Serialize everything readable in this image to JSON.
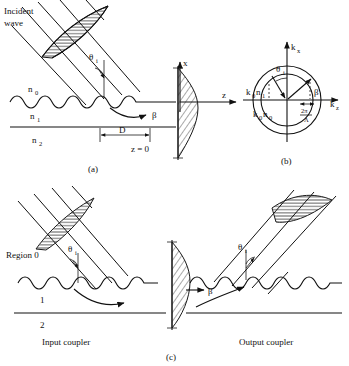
{
  "figure": {
    "panels": [
      {
        "id": "a",
        "caption": "(a)",
        "labels": {
          "incident_wave_line1": "Incident",
          "incident_wave_line2": "wave",
          "angle": "θ",
          "angle_sub": "i",
          "index_cover": "n",
          "index_cover_sub": "0",
          "index_guide": "n",
          "index_guide_sub": "1",
          "index_substrate": "n",
          "index_substrate_sub": "2",
          "propagation_constant": "β",
          "axis_x": "x",
          "axis_z": "z",
          "grating_length": "D",
          "origin": "z = 0"
        }
      },
      {
        "id": "b",
        "caption": "(b)",
        "labels": {
          "axis_kx": "k",
          "axis_kx_sub": "x",
          "axis_kz": "k",
          "axis_kz_sub": "z",
          "radius_outer": "k",
          "radius_outer_sub": "0",
          "radius_outer_index": "n",
          "radius_outer_index_sub": "1",
          "radius_inner": "k",
          "radius_inner_sub": "0",
          "radius_inner_index": "n",
          "radius_inner_index_sub": "0",
          "angle": "θ",
          "angle_sub": "i",
          "propagation_constant": "β",
          "grating_vector_num": "2π",
          "grating_vector_den": "Λ"
        }
      },
      {
        "id": "c",
        "caption": "(c)",
        "labels": {
          "region_0": "Region 0",
          "region_1": "1",
          "region_2": "2",
          "input_coupler": "Input coupler",
          "output_coupler": "Output coupler",
          "angle_in": "θ",
          "angle_in_sub": "i",
          "angle_out": "θ",
          "angle_out_sub": "i",
          "propagation_constant": "β"
        }
      }
    ],
    "colors": {
      "ink": "#111111",
      "background": "#ffffff"
    }
  }
}
